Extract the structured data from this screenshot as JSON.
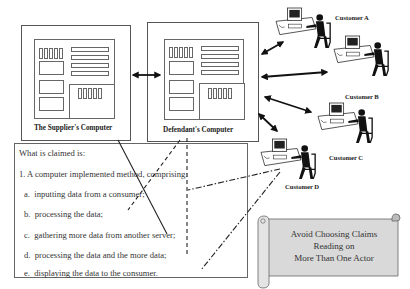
{
  "computers": {
    "supplier": {
      "label": "The Supplier's Computer"
    },
    "defendant": {
      "label": "Defendant's Computer"
    }
  },
  "customers": [
    {
      "label": "Customer A"
    },
    {
      "label": "Customer B"
    },
    {
      "label": "Customer C"
    },
    {
      "label": "Customer D"
    }
  ],
  "claims": {
    "heading": "What is claimed is:",
    "preamble": "1. A  computer implemented method, comprising:",
    "steps": [
      {
        "letter": "a.",
        "text": "inputting data from a consumer;"
      },
      {
        "letter": "b.",
        "text": "processing the data;"
      },
      {
        "letter": "c.",
        "text": "gathering more data from another server;"
      },
      {
        "letter": "d.",
        "text": "processing the data and the more data;"
      },
      {
        "letter": "e.",
        "text": "displaying the data to the consumer."
      }
    ]
  },
  "banner": {
    "lines": [
      "Avoid Choosing Claims",
      "Reading on",
      "More Than One Actor"
    ],
    "fill": "#d9d9d9"
  }
}
